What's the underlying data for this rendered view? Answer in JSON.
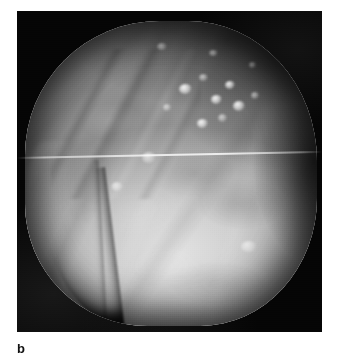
{
  "figure": {
    "panel_label": "b",
    "kind": "grayscale-planetary-image",
    "plate": {
      "background_color": "#050505",
      "page_background_color": "#ffffff",
      "x": 17,
      "y": 11,
      "width": 305,
      "height": 321
    },
    "body": {
      "silhouette": "rounded-square irregular disc filling most of the frame",
      "highlight_color": "#e2e2e2",
      "midtone_color": "#b4b4b4",
      "shadow_color": "#4a4a4a",
      "illumination": "bright lower-left to centre, terminator shading on upper-right limb"
    },
    "features": [
      {
        "name": "bright-crater-cluster",
        "location": "upper-centre-right",
        "count": 9
      },
      {
        "name": "dark-crescent-groove",
        "location": "lower-left limb"
      },
      {
        "name": "ridge-set",
        "location": "upper-left"
      },
      {
        "name": "bright-patch",
        "location": "lower-right limb"
      },
      {
        "name": "scanline-artifact",
        "location": "horizontal, upper-middle"
      }
    ],
    "spots": [
      {
        "x": 168,
        "y": 78,
        "w": 13,
        "h": 10,
        "dim": false
      },
      {
        "x": 186,
        "y": 66,
        "w": 9,
        "h": 7,
        "dim": true
      },
      {
        "x": 199,
        "y": 88,
        "w": 11,
        "h": 9,
        "dim": false
      },
      {
        "x": 213,
        "y": 74,
        "w": 10,
        "h": 8,
        "dim": false
      },
      {
        "x": 222,
        "y": 95,
        "w": 12,
        "h": 10,
        "dim": false
      },
      {
        "x": 205,
        "y": 107,
        "w": 9,
        "h": 8,
        "dim": true
      },
      {
        "x": 185,
        "y": 112,
        "w": 11,
        "h": 9,
        "dim": false
      },
      {
        "x": 238,
        "y": 84,
        "w": 8,
        "h": 7,
        "dim": true
      },
      {
        "x": 150,
        "y": 96,
        "w": 8,
        "h": 7,
        "dim": true
      },
      {
        "x": 145,
        "y": 35,
        "w": 10,
        "h": 7,
        "dim": true
      },
      {
        "x": 196,
        "y": 42,
        "w": 9,
        "h": 6,
        "dim": true
      },
      {
        "x": 235,
        "y": 54,
        "w": 7,
        "h": 6,
        "dim": true
      },
      {
        "x": 262,
        "y": 290,
        "w": 13,
        "h": 7,
        "dim": false
      },
      {
        "x": 248,
        "y": 298,
        "w": 10,
        "h": 6,
        "dim": true
      },
      {
        "x": 272,
        "y": 283,
        "w": 8,
        "h": 5,
        "dim": true
      },
      {
        "x": 100,
        "y": 175,
        "w": 12,
        "h": 9,
        "dim": true
      },
      {
        "x": 132,
        "y": 146,
        "w": 14,
        "h": 11,
        "dim": true
      },
      {
        "x": 232,
        "y": 235,
        "w": 16,
        "h": 11,
        "dim": true
      }
    ]
  }
}
